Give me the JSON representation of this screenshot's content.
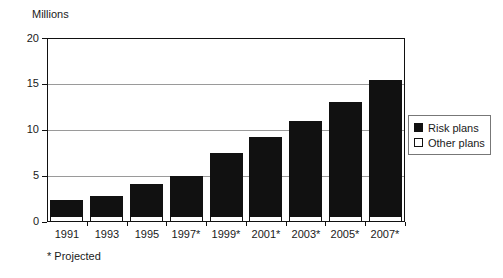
{
  "chart_data": {
    "type": "bar",
    "title": "",
    "ylabel": "Millions",
    "xlabel": "",
    "ylim": [
      0,
      20
    ],
    "yticks": [
      0,
      5,
      10,
      15,
      20
    ],
    "grid": true,
    "stacked": true,
    "legend_position": "right",
    "categories": [
      "1991",
      "1993",
      "1995",
      "1997*",
      "1999*",
      "2001*",
      "2003*",
      "2005*",
      "2007*"
    ],
    "series": [
      {
        "name": "Risk plans",
        "color": "#111111",
        "values": [
          1.8,
          2.2,
          3.4,
          4.3,
          6.9,
          8.6,
          10.4,
          12.4,
          14.8
        ]
      },
      {
        "name": "Other plans",
        "color": "#ffffff",
        "values": [
          0.6,
          0.6,
          0.7,
          0.7,
          0.6,
          0.6,
          0.6,
          0.6,
          0.6
        ]
      }
    ],
    "totals": [
      2.4,
      2.8,
      4.1,
      5.0,
      7.5,
      9.2,
      11.0,
      13.0,
      15.4
    ],
    "annotations": [
      "* Projected"
    ]
  },
  "axis": {
    "y_title": "Millions",
    "y_tick_labels": [
      "20",
      "15",
      "10",
      "5",
      "0"
    ],
    "x_tick_labels": [
      "1991",
      "1993",
      "1995",
      "1997*",
      "1999*",
      "2001*",
      "2003*",
      "2005*",
      "2007*"
    ]
  },
  "legend": {
    "items": [
      {
        "label": "Risk plans",
        "swatch": "filled-square-swatch"
      },
      {
        "label": "Other plans",
        "swatch": "hollow-square-swatch"
      }
    ]
  },
  "footnote": {
    "text": "* Projected"
  },
  "colors": {
    "risk_plans": "#111111",
    "other_plans": "#ffffff",
    "axis": "#111111",
    "gridline": "#9a9a9a",
    "background": "#ffffff"
  }
}
